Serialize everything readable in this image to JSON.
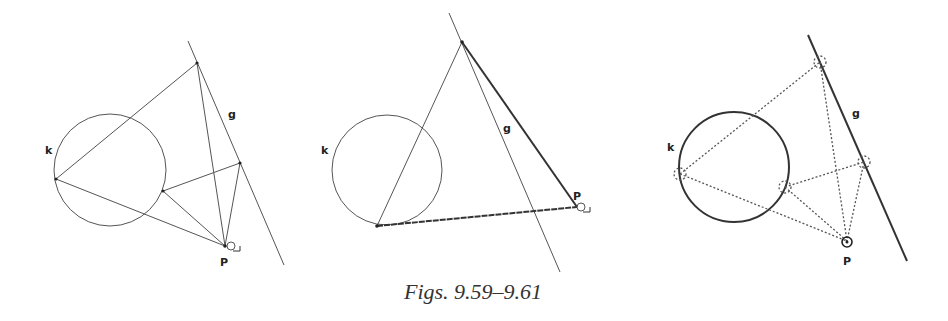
{
  "caption": "Figs. 9.59–9.61",
  "figures": [
    {
      "id": "9.59",
      "labels": {
        "circle": "k",
        "line": "g",
        "point": "P"
      }
    },
    {
      "id": "9.60",
      "labels": {
        "circle": "k",
        "line": "g",
        "point": "P"
      }
    },
    {
      "id": "9.61",
      "labels": {
        "circle": "k",
        "line": "g",
        "point": "P"
      }
    }
  ],
  "colors": {
    "stroke": "#444444",
    "background": "#ffffff"
  }
}
